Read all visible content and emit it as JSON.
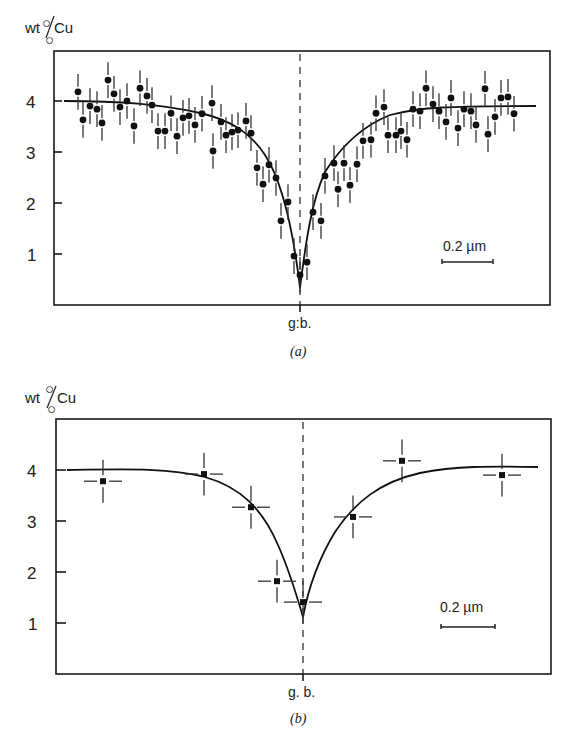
{
  "chart_data": [
    {
      "type": "scatter",
      "panel_label": "(a)",
      "ylabel": "wt%Cu",
      "ylabel_main": "wt",
      "ylabel_unit": "Cu",
      "xlabel": "g.b.",
      "yticks": [
        1,
        2,
        3,
        4
      ],
      "ylim": [
        0,
        5
      ],
      "grid": false,
      "scale_bar": "0.2 µm",
      "boundary_marker": "g.b. (dashed vertical line)",
      "fit_curve": "profile depleted at grain boundary: ~4.0 far field, minimum ~0.4 at g.b.",
      "series": [
        {
          "name": "measured points (dots with vertical error bars ±~0.35)",
          "marker": "circle",
          "x_px": [
            78,
            83,
            90,
            97,
            102,
            108,
            114,
            120,
            127,
            134,
            140,
            147,
            152,
            158,
            165,
            171,
            177,
            183,
            189,
            195,
            202,
            212,
            213,
            221,
            226,
            232,
            238,
            246,
            251,
            257,
            263,
            269,
            276,
            281,
            288,
            294,
            300,
            307,
            313,
            321,
            325,
            334,
            338,
            344,
            350,
            357,
            363,
            371,
            376,
            384,
            388,
            396,
            401,
            407,
            413,
            420,
            426,
            433,
            439,
            446,
            451,
            458,
            464,
            471,
            476,
            485,
            488,
            495,
            501,
            508,
            514
          ],
          "values": [
            4.18,
            3.63,
            3.9,
            3.84,
            3.57,
            4.41,
            4.14,
            3.88,
            4.0,
            3.51,
            4.25,
            4.1,
            3.92,
            3.41,
            3.41,
            3.76,
            3.31,
            3.67,
            3.71,
            3.53,
            3.75,
            3.96,
            3.02,
            3.59,
            3.33,
            3.39,
            3.43,
            3.61,
            3.37,
            2.69,
            2.37,
            2.75,
            2.49,
            1.65,
            2.02,
            0.96,
            0.59,
            0.84,
            1.82,
            1.65,
            2.53,
            2.78,
            2.27,
            2.78,
            2.35,
            2.76,
            3.22,
            3.24,
            3.76,
            3.88,
            3.33,
            3.33,
            3.41,
            3.24,
            3.84,
            3.8,
            4.25,
            3.94,
            3.8,
            3.59,
            4.06,
            3.47,
            3.84,
            3.8,
            3.53,
            4.24,
            3.35,
            3.69,
            4.06,
            4.08,
            3.75
          ],
          "error": 0.35
        }
      ]
    },
    {
      "type": "scatter",
      "panel_label": "(b)",
      "ylabel": "wt%Cu",
      "ylabel_main": "wt",
      "ylabel_unit": "Cu",
      "xlabel": "g. b.",
      "yticks": [
        1,
        2,
        3,
        4
      ],
      "ylim": [
        0,
        5
      ],
      "grid": false,
      "scale_bar": "0.2 µm",
      "boundary_marker": "g.b. (dashed vertical line)",
      "fit_curve": "profile depleted at grain boundary: ~4.0 far field, minimum ~1.1 at g.b.",
      "series": [
        {
          "name": "measured points (squares with x and y error bars)",
          "marker": "square",
          "x_px": [
            103,
            204,
            251,
            277,
            303,
            353,
            402,
            502
          ],
          "values": [
            3.78,
            3.92,
            3.27,
            1.82,
            1.41,
            3.08,
            4.18,
            3.9
          ],
          "error": 0.42
        }
      ]
    }
  ],
  "labels": {
    "a_ylabel_main": "wt",
    "a_ylabel_unit": "Cu",
    "a_tick_1": "1",
    "a_tick_2": "2",
    "a_tick_3": "3",
    "a_tick_4": "4",
    "a_gb": "g:b.",
    "a_panel": "(a)",
    "a_scale": "0.2 µm",
    "b_ylabel_main": "wt",
    "b_ylabel_unit": "Cu",
    "b_tick_1": "1",
    "b_tick_2": "2",
    "b_tick_3": "3",
    "b_tick_4": "4",
    "b_gb": "g. b.",
    "b_panel": "(b)",
    "b_scale": "0.2 µm"
  }
}
